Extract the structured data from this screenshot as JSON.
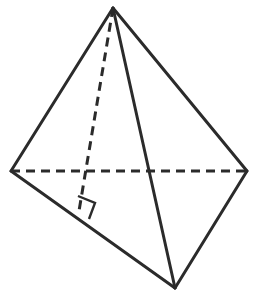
{
  "figure": {
    "name": "tetrahedron-with-altitude",
    "canvas": {
      "width": 255,
      "height": 304,
      "background": "#ffffff"
    },
    "style": {
      "stroke_color": "#2b2b2b",
      "stroke_width": 3,
      "dash_pattern": "9 6",
      "marker_stroke_width": 2.4
    },
    "vertices": [
      {
        "id": "apex",
        "label": "apex",
        "x": 113,
        "y": 8
      },
      {
        "id": "left",
        "label": "left vertex",
        "x": 11,
        "y": 171
      },
      {
        "id": "right",
        "label": "right vertex",
        "x": 247,
        "y": 171
      },
      {
        "id": "front",
        "label": "front vertex",
        "x": 175,
        "y": 288
      },
      {
        "id": "altitude-foot",
        "label": "foot of altitude",
        "x": 79,
        "y": 211
      }
    ],
    "edges": [
      {
        "id": "apex-left",
        "from": "apex",
        "to": "left",
        "kind": "solid",
        "hidden": false
      },
      {
        "id": "apex-right",
        "from": "apex",
        "to": "right",
        "kind": "solid",
        "hidden": false
      },
      {
        "id": "apex-front",
        "from": "apex",
        "to": "front",
        "kind": "solid",
        "hidden": false
      },
      {
        "id": "left-front",
        "from": "left",
        "to": "front",
        "kind": "solid",
        "hidden": false
      },
      {
        "id": "right-front",
        "from": "right",
        "to": "front",
        "kind": "solid",
        "hidden": false
      },
      {
        "id": "left-right",
        "from": "left",
        "to": "right",
        "kind": "dashed",
        "hidden": true
      }
    ],
    "altitude": {
      "id": "apex-altitude",
      "from": "apex",
      "to": "altitude-foot",
      "kind": "dashed",
      "hidden": true
    },
    "right_angle_marker": {
      "id": "right-angle-marker",
      "at": "altitude-foot",
      "points": "78,196 95,203 89,219"
    }
  }
}
